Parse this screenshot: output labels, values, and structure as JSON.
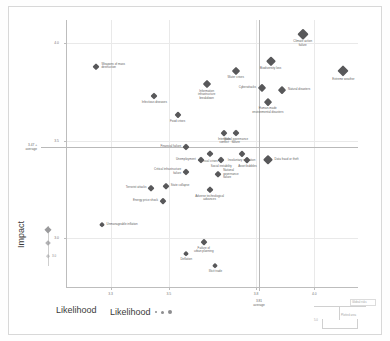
{
  "chart_data": {
    "type": "scatter",
    "title": "",
    "xlabel": "Likelihood",
    "ylabel": "Impact",
    "xlim": [
      3.15,
      4.15
    ],
    "ylim": [
      2.75,
      4.12
    ],
    "grid": true,
    "xticks": [
      "3.3",
      "3.5",
      "3.8",
      "4.0"
    ],
    "xtick_values": [
      3.3,
      3.5,
      3.8,
      4.0
    ],
    "yticks": [
      "4.0",
      "3.5",
      "3.0"
    ],
    "ytick_values": [
      4.0,
      3.5,
      3.0
    ],
    "x_average_value": 3.81,
    "x_average_label": "3.81",
    "x_average_sublabel": "average",
    "y_average_value": 3.47,
    "y_average_label": "3.47",
    "y_average_sublabel": "average",
    "legend_position": "bottom-left",
    "points": [
      {
        "label": "Climate action\nfailure",
        "x": 3.96,
        "y": 4.05,
        "size": 7.6,
        "lpos": "cb"
      },
      {
        "label": "Extreme weather",
        "x": 4.1,
        "y": 3.86,
        "size": 8.2,
        "lpos": "cb"
      },
      {
        "label": "Biodiversity loss",
        "x": 3.85,
        "y": 3.91,
        "size": 6.6,
        "lpos": "cb"
      },
      {
        "label": "Water crises",
        "x": 3.73,
        "y": 3.86,
        "size": 6.0,
        "lpos": "cb"
      },
      {
        "label": "Natural disasters",
        "x": 3.89,
        "y": 3.76,
        "size": 5.8,
        "lpos": "r"
      },
      {
        "label": "Cyberattacks",
        "x": 3.82,
        "y": 3.77,
        "size": 6.2,
        "lpos": "l"
      },
      {
        "label": "Human-made\nenvironmental disasters",
        "x": 3.84,
        "y": 3.7,
        "size": 5.8,
        "lpos": "cb"
      },
      {
        "label": "Information\ninfrastructure\nbreakdown",
        "x": 3.63,
        "y": 3.79,
        "size": 6.0,
        "lpos": "cb"
      },
      {
        "label": "Weapons of mass\ndestruction",
        "x": 3.25,
        "y": 3.88,
        "size": 5.4,
        "lpos": "r"
      },
      {
        "label": "Infectious diseases",
        "x": 3.45,
        "y": 3.73,
        "size": 5.0,
        "lpos": "cb"
      },
      {
        "label": "Food crises",
        "x": 3.53,
        "y": 3.63,
        "size": 5.2,
        "lpos": "cb"
      },
      {
        "label": "Interstate\nconflict",
        "x": 3.69,
        "y": 3.54,
        "size": 4.8,
        "lpos": "cb"
      },
      {
        "label": "Global governance\nfailure",
        "x": 3.73,
        "y": 3.54,
        "size": 5.0,
        "lpos": "cb"
      },
      {
        "label": "Financial failure",
        "x": 3.56,
        "y": 3.47,
        "size": 5.0,
        "lpos": "l"
      },
      {
        "label": "Fiscal crises",
        "x": 3.64,
        "y": 3.43,
        "size": 5.4,
        "lpos": "cb"
      },
      {
        "label": "Involuntary migration",
        "x": 3.75,
        "y": 3.43,
        "size": 5.2,
        "lpos": "cb"
      },
      {
        "label": "Asset bubbles",
        "x": 3.77,
        "y": 3.4,
        "size": 4.8,
        "lpos": "cb"
      },
      {
        "label": "Data fraud or theft",
        "x": 3.84,
        "y": 3.4,
        "size": 7.4,
        "lpos": "r"
      },
      {
        "label": "Unemployment",
        "x": 3.61,
        "y": 3.4,
        "size": 5.0,
        "lpos": "l"
      },
      {
        "label": "Social instability",
        "x": 3.68,
        "y": 3.4,
        "size": 5.0,
        "lpos": "cb"
      },
      {
        "label": "Critical infrastructure\nfailure",
        "x": 3.56,
        "y": 3.34,
        "size": 5.0,
        "lpos": "l"
      },
      {
        "label": "National\ngovernance\nfailure",
        "x": 3.67,
        "y": 3.33,
        "size": 4.6,
        "lpos": "r"
      },
      {
        "label": "State collapse",
        "x": 3.49,
        "y": 3.27,
        "size": 4.6,
        "lpos": "r"
      },
      {
        "label": "Terrorist attacks",
        "x": 3.44,
        "y": 3.26,
        "size": 4.6,
        "lpos": "l"
      },
      {
        "label": "Adverse technological\nadvances",
        "x": 3.64,
        "y": 3.25,
        "size": 5.4,
        "lpos": "cb"
      },
      {
        "label": "Energy price shock",
        "x": 3.48,
        "y": 3.19,
        "size": 4.8,
        "lpos": "l"
      },
      {
        "label": "Unmanageable inflation",
        "x": 3.27,
        "y": 3.07,
        "size": 4.4,
        "lpos": "r"
      },
      {
        "label": "Failure of\nurban planning",
        "x": 3.62,
        "y": 2.98,
        "size": 4.8,
        "lpos": "cb"
      },
      {
        "label": "Deflation",
        "x": 3.56,
        "y": 2.92,
        "size": 4.4,
        "lpos": "cb"
      },
      {
        "label": "Illicit trade",
        "x": 3.66,
        "y": 2.86,
        "size": 4.4,
        "lpos": "cb"
      }
    ]
  },
  "axes": {
    "x_title": "Likelihood",
    "y_title": "Impact"
  },
  "size_legend": {
    "items": [
      "large",
      "medium",
      "small"
    ],
    "tick_label": "3.0"
  },
  "likelihood_legend": {
    "label": "Likelihood",
    "markers": [
      "small",
      "medium",
      "large"
    ]
  },
  "corner_note": {
    "label": "Global\nrisks",
    "small": "5.0",
    "mid": "Plotted\narea"
  }
}
